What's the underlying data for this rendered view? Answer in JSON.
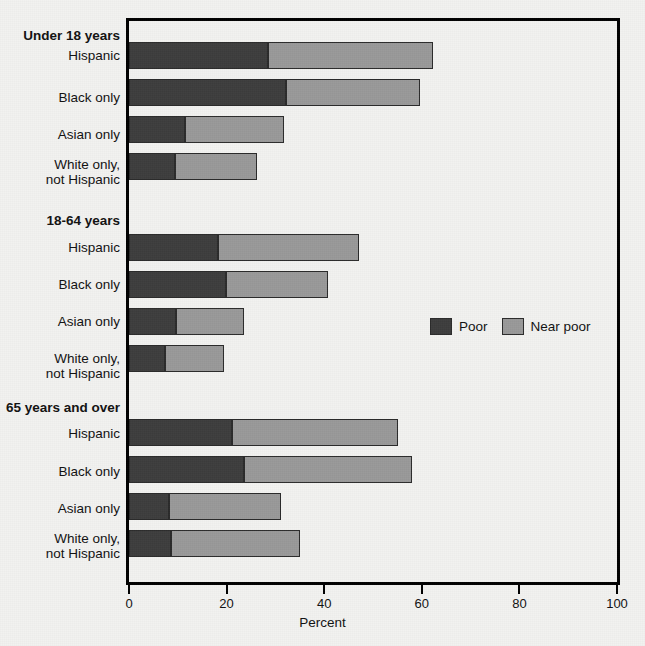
{
  "chart_data": {
    "type": "bar",
    "subtype": "stacked-horizontal",
    "title": "",
    "xlabel": "Percent",
    "ylabel": "",
    "xlim": [
      0,
      100
    ],
    "xticks": [
      0,
      20,
      40,
      60,
      80,
      100
    ],
    "xtick_labels": [
      "0",
      "20",
      "40",
      "60",
      "80",
      "100"
    ],
    "grid": false,
    "legend_position": "middle-right",
    "colors": {
      "poor": "#3d3d3d",
      "near_poor": "#999999",
      "axis": "#000000",
      "background": "#f2f2f0",
      "text": "#111111"
    },
    "series": [
      {
        "name": "Poor",
        "values": [
          28.5,
          32.1,
          11.4,
          9.5,
          18.2,
          19.9,
          9.6,
          7.4,
          21.1,
          23.6,
          8.1,
          8.6
        ]
      },
      {
        "name": "Near poor",
        "values": [
          33.8,
          27.5,
          20.3,
          16.7,
          28.9,
          20.8,
          14.0,
          12.0,
          34.0,
          34.4,
          23.1,
          26.5
        ]
      }
    ],
    "groups": [
      {
        "header": "Under 18 years",
        "categories": [
          "Hispanic",
          "Black only",
          "Asian only",
          "White only, not Hispanic"
        ],
        "poor": [
          28.5,
          32.1,
          11.4,
          9.5
        ],
        "near_poor": [
          33.8,
          27.5,
          20.3,
          16.7
        ],
        "totals": [
          62.3,
          59.6,
          31.7,
          26.2
        ]
      },
      {
        "header": "18-64 years",
        "categories": [
          "Hispanic",
          "Black only",
          "Asian only",
          "White only, not Hispanic"
        ],
        "poor": [
          18.2,
          19.9,
          9.6,
          7.4
        ],
        "near_poor": [
          28.9,
          20.8,
          14.0,
          12.0
        ],
        "totals": [
          47.1,
          40.7,
          23.6,
          19.4
        ]
      },
      {
        "header": "65 years and over",
        "categories": [
          "Hispanic",
          "Black only",
          "Asian only",
          "White only, not Hispanic"
        ],
        "poor": [
          21.1,
          23.6,
          8.1,
          8.6
        ],
        "near_poor": [
          34.0,
          34.4,
          23.1,
          26.5
        ],
        "totals": [
          55.1,
          58.0,
          31.2,
          35.1
        ]
      }
    ],
    "legend": [
      {
        "label": "Poor",
        "color": "#3d3d3d"
      },
      {
        "label": "Near poor",
        "color": "#999999"
      }
    ]
  },
  "labels": {
    "group_1_header": "Under 18 years",
    "group_2_header": "18-64 years",
    "group_3_header": "65 years and over",
    "hispanic": "Hispanic",
    "black_only": "Black only",
    "asian_only": "Asian only",
    "white_only_line1": "White only,",
    "white_only_line2": "not Hispanic"
  },
  "axis": {
    "x_title": "Percent",
    "tick_0": "0",
    "tick_20": "20",
    "tick_40": "40",
    "tick_60": "60",
    "tick_80": "80",
    "tick_100": "100"
  },
  "legend": {
    "poor_label": "Poor",
    "near_poor_label": "Near poor"
  }
}
